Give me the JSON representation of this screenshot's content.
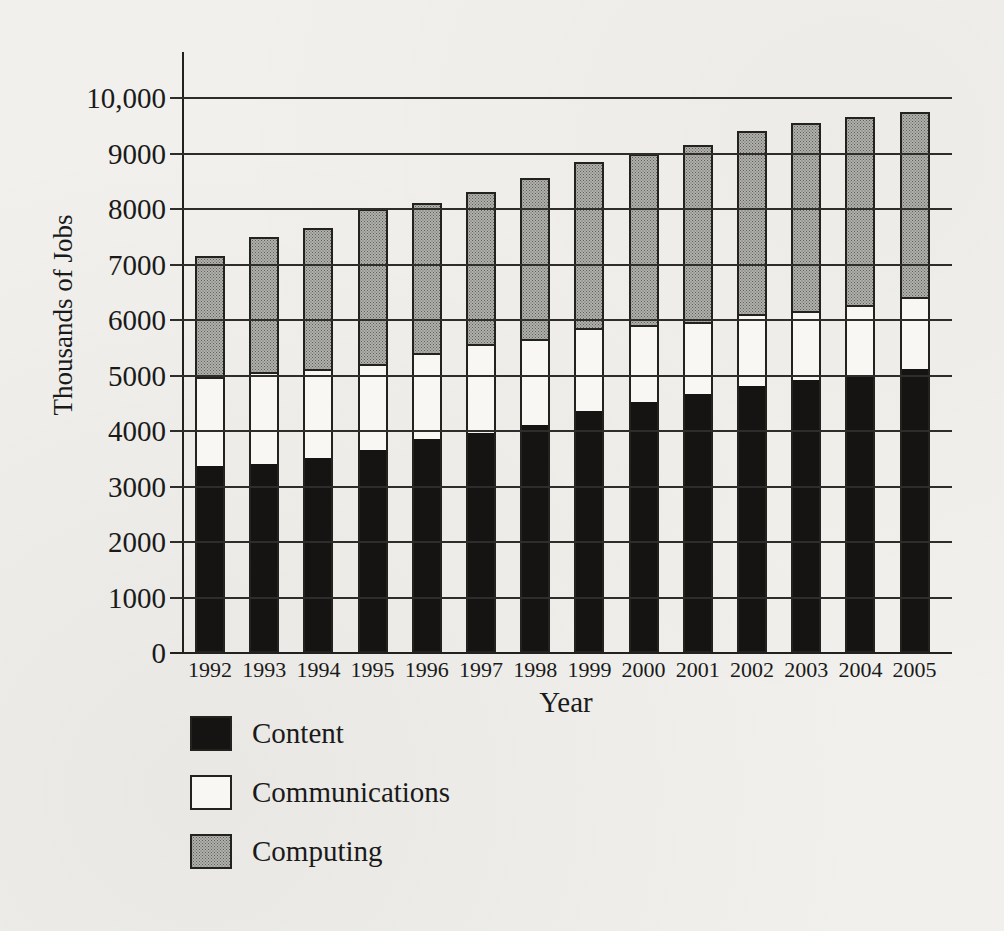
{
  "figure": {
    "y_axis_title": "Thousands of Jobs",
    "x_axis_title": "Year"
  },
  "legend": {
    "items": [
      {
        "label": "Content",
        "swatch": "solid-black",
        "color": "#151413"
      },
      {
        "label": "Communications",
        "swatch": "white",
        "color": "#f8f7f3"
      },
      {
        "label": "Computing",
        "swatch": "halftone-gray",
        "color": "#9a9a98"
      }
    ]
  },
  "chart_data": {
    "type": "bar",
    "stacked": true,
    "title": "",
    "xlabel": "Year",
    "ylabel": "Thousands of Jobs",
    "categories": [
      "1992",
      "1993",
      "1994",
      "1995",
      "1996",
      "1997",
      "1998",
      "1999",
      "2000",
      "2001",
      "2002",
      "2003",
      "2004",
      "2005"
    ],
    "series": [
      {
        "name": "Content",
        "values": [
          3400,
          3450,
          3550,
          3700,
          3900,
          4000,
          4150,
          4400,
          4550,
          4700,
          4850,
          4950,
          5050,
          5150
        ]
      },
      {
        "name": "Communications",
        "values": [
          1600,
          1650,
          1600,
          1550,
          1550,
          1600,
          1550,
          1500,
          1400,
          1300,
          1300,
          1250,
          1250,
          1300
        ]
      },
      {
        "name": "Computing",
        "values": [
          2150,
          2400,
          2500,
          2750,
          2650,
          2700,
          2850,
          2950,
          3050,
          3150,
          3250,
          3350,
          3350,
          3300
        ]
      }
    ],
    "stack_totals": [
      7150,
      7500,
      7650,
      8000,
      8100,
      8300,
      8550,
      8850,
      9000,
      9150,
      9400,
      9550,
      9650,
      9750
    ],
    "ylim": [
      0,
      10000
    ],
    "ytick_interval": 1000,
    "ytick_labels": [
      "0",
      "1000",
      "2000",
      "3000",
      "4000",
      "5000",
      "6000",
      "7000",
      "8000",
      "9000",
      "10,000"
    ],
    "grid": "horizontal",
    "legend_position": "below-left"
  },
  "colors": {
    "background": "#f1f0ec",
    "bar_outline": "#23221f",
    "gridline": "#2e2d2b",
    "content_fill": "#151413",
    "communications_fill": "#f8f7f3",
    "computing_fill": "#9a9a98",
    "text": "#1a1a1a"
  }
}
